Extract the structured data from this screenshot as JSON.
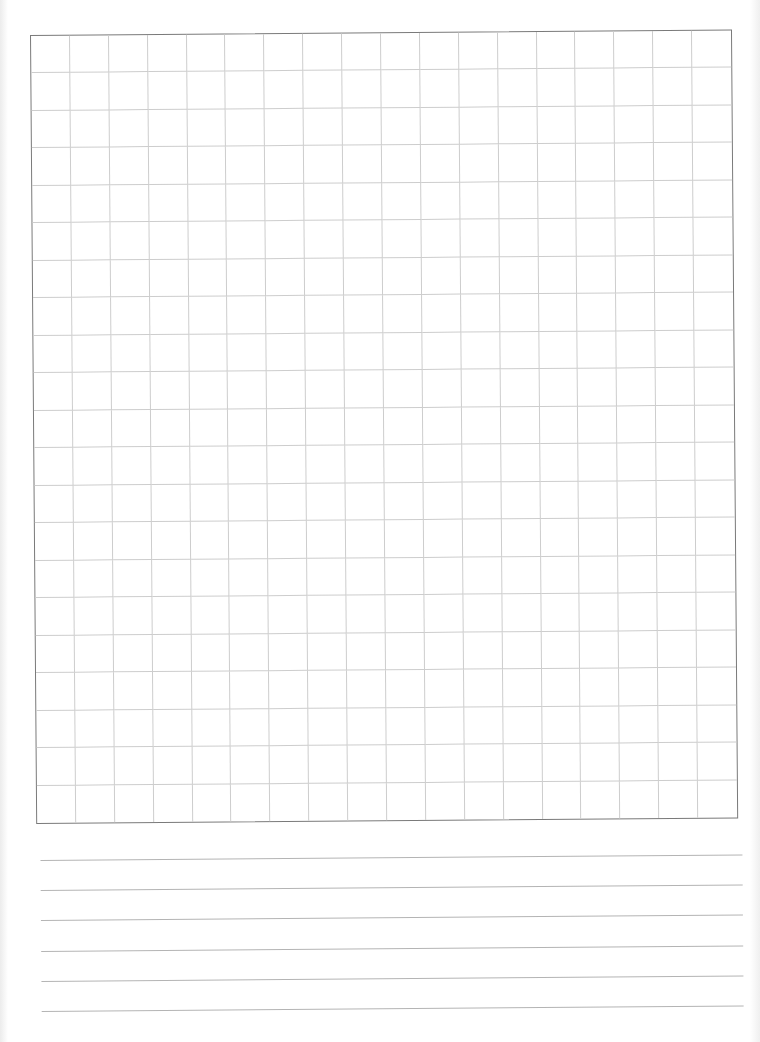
{
  "page": {
    "type": "graph-paper-worksheet",
    "background_color": "#ffffff"
  },
  "grid": {
    "columns": 18,
    "rows": 21,
    "cell_width_px": 39,
    "cell_height_px": 37.57,
    "border_color": "#7a7a7a",
    "line_color": "#cdcdcd"
  },
  "writing_lines": {
    "count": 6,
    "spacing_px": 30.2,
    "line_color": "#b4b4b4"
  }
}
